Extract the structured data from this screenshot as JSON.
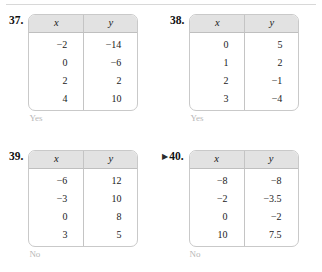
{
  "page": {
    "top_rule": true
  },
  "exercises": [
    {
      "number": "37.",
      "marker": "",
      "headers": {
        "x": "x",
        "y": "y"
      },
      "rows": [
        {
          "x": "−2",
          "y": "−14"
        },
        {
          "x": "0",
          "y": "−6"
        },
        {
          "x": "2",
          "y": "2"
        },
        {
          "x": "4",
          "y": "10"
        }
      ],
      "answer": "Yes"
    },
    {
      "number": "38.",
      "marker": "",
      "headers": {
        "x": "x",
        "y": "y"
      },
      "rows": [
        {
          "x": "0",
          "y": "5"
        },
        {
          "x": "1",
          "y": "2"
        },
        {
          "x": "2",
          "y": "−1"
        },
        {
          "x": "3",
          "y": "−4"
        }
      ],
      "answer": "Yes"
    },
    {
      "number": "39.",
      "marker": "",
      "headers": {
        "x": "x",
        "y": "y"
      },
      "rows": [
        {
          "x": "−6",
          "y": "12"
        },
        {
          "x": "−3",
          "y": "10"
        },
        {
          "x": "0",
          "y": "8"
        },
        {
          "x": "3",
          "y": "5"
        }
      ],
      "answer": "No"
    },
    {
      "number": "40.",
      "marker": "▶",
      "headers": {
        "x": "x",
        "y": "y"
      },
      "rows": [
        {
          "x": "−8",
          "y": "−8"
        },
        {
          "x": "−2",
          "y": "−3.5"
        },
        {
          "x": "0",
          "y": "−2"
        },
        {
          "x": "10",
          "y": "7.5"
        }
      ],
      "answer": "No"
    }
  ],
  "colors": {
    "header_fill": "#e2e2e2",
    "table_border": "#c9c9c9",
    "answer_text": "#b7b7b7",
    "body_text": "#1a1a1a"
  }
}
